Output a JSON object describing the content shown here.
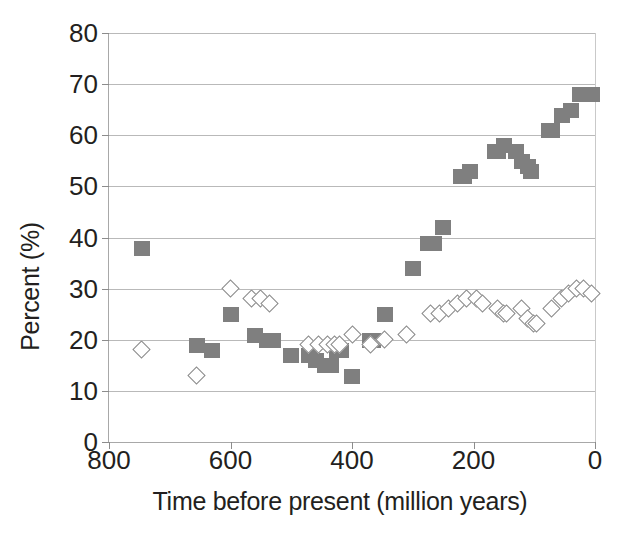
{
  "chart_data": {
    "type": "scatter",
    "title": "",
    "xlabel": "Time before present (million years)",
    "ylabel": "Percent (%)",
    "xlim": [
      800,
      0
    ],
    "ylim": [
      0,
      80
    ],
    "x_reversed": true,
    "grid": true,
    "legend": "none",
    "xticks": [
      800,
      600,
      400,
      200,
      0
    ],
    "yticks": [
      0,
      10,
      20,
      30,
      40,
      50,
      60,
      70,
      80
    ],
    "series": [
      {
        "name": "filled-squares",
        "marker": "square",
        "color": "#7f7f7f",
        "points": [
          [
            745,
            38
          ],
          [
            655,
            19
          ],
          [
            630,
            18
          ],
          [
            600,
            25
          ],
          [
            560,
            21
          ],
          [
            540,
            20
          ],
          [
            530,
            20
          ],
          [
            500,
            17
          ],
          [
            470,
            17
          ],
          [
            460,
            16
          ],
          [
            445,
            15
          ],
          [
            435,
            15
          ],
          [
            425,
            18
          ],
          [
            418,
            18
          ],
          [
            400,
            13
          ],
          [
            370,
            20
          ],
          [
            365,
            20
          ],
          [
            345,
            25
          ],
          [
            300,
            34
          ],
          [
            275,
            39
          ],
          [
            265,
            39
          ],
          [
            250,
            42
          ],
          [
            220,
            52
          ],
          [
            215,
            52
          ],
          [
            205,
            53
          ],
          [
            165,
            57
          ],
          [
            160,
            57
          ],
          [
            150,
            58
          ],
          [
            130,
            57
          ],
          [
            120,
            55
          ],
          [
            110,
            54
          ],
          [
            105,
            53
          ],
          [
            75,
            61
          ],
          [
            70,
            61
          ],
          [
            55,
            64
          ],
          [
            40,
            65
          ],
          [
            25,
            68
          ],
          [
            15,
            68
          ],
          [
            5,
            68
          ]
        ]
      },
      {
        "name": "open-diamonds",
        "marker": "diamond",
        "color": "#8a8a8a",
        "points": [
          [
            745,
            18
          ],
          [
            655,
            13
          ],
          [
            600,
            30
          ],
          [
            565,
            28
          ],
          [
            550,
            28
          ],
          [
            535,
            27
          ],
          [
            470,
            19
          ],
          [
            455,
            19
          ],
          [
            440,
            19
          ],
          [
            428,
            19
          ],
          [
            420,
            19
          ],
          [
            398,
            21
          ],
          [
            368,
            19
          ],
          [
            345,
            20
          ],
          [
            310,
            21
          ],
          [
            270,
            25
          ],
          [
            255,
            25
          ],
          [
            240,
            26
          ],
          [
            225,
            27
          ],
          [
            210,
            28
          ],
          [
            195,
            28
          ],
          [
            185,
            27
          ],
          [
            160,
            26
          ],
          [
            150,
            25
          ],
          [
            145,
            25
          ],
          [
            120,
            26
          ],
          [
            110,
            24
          ],
          [
            100,
            23
          ],
          [
            95,
            23
          ],
          [
            70,
            26
          ],
          [
            55,
            28
          ],
          [
            42,
            29
          ],
          [
            30,
            30
          ],
          [
            18,
            30
          ],
          [
            5,
            29
          ]
        ]
      }
    ]
  },
  "axis": {
    "y_title": "Percent (%)",
    "x_title": "Time before present (million years)",
    "y_tick_labels": [
      "0",
      "10",
      "20",
      "30",
      "40",
      "50",
      "60",
      "70",
      "80"
    ],
    "x_tick_labels": [
      "800",
      "600",
      "400",
      "200",
      "0"
    ]
  }
}
